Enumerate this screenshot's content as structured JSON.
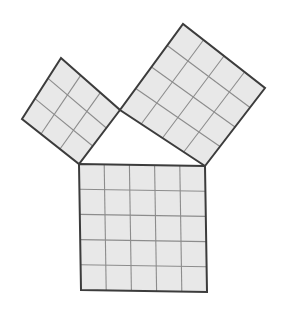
{
  "figure": {
    "background_color": "#ffffff",
    "square_fill_color": "#e8e8e8",
    "grid_line_color": "#8c8c8c",
    "outline_color": "#3c3c3c",
    "outline_width": 2,
    "grid_line_width": 1.1,
    "canvas": {
      "width": 284,
      "height": 315
    }
  },
  "triangle": {
    "name": "right-triangle",
    "right_angle_vertex": {
      "x": 120,
      "y": 110
    },
    "vertex_left": {
      "x": 79,
      "y": 164
    },
    "vertex_right": {
      "x": 205,
      "y": 166
    },
    "leg_a_length_units": 3,
    "leg_b_length_units": 4,
    "hypotenuse_length_units": 5
  },
  "squares": [
    {
      "id": "square-a",
      "label": "small square on short leg",
      "divisions": 3,
      "unit_area": 9,
      "corners": [
        {
          "x": 120,
          "y": 110
        },
        {
          "x": 79,
          "y": 164
        },
        {
          "x": 22,
          "y": 119
        },
        {
          "x": 61,
          "y": 58
        }
      ]
    },
    {
      "id": "square-b",
      "label": "medium square on long leg",
      "divisions": 4,
      "unit_area": 16,
      "corners": [
        {
          "x": 205,
          "y": 166
        },
        {
          "x": 120,
          "y": 110
        },
        {
          "x": 183,
          "y": 24
        },
        {
          "x": 265,
          "y": 88
        }
      ]
    },
    {
      "id": "square-c",
      "label": "large square on hypotenuse",
      "divisions": 5,
      "unit_area": 25,
      "corners": [
        {
          "x": 79,
          "y": 164
        },
        {
          "x": 205,
          "y": 166
        },
        {
          "x": 207,
          "y": 292
        },
        {
          "x": 81,
          "y": 290
        }
      ]
    }
  ],
  "chart_data": {
    "type": "diagram",
    "relation": "3^2 + 4^2 = 5^2",
    "areas": {
      "a": 9,
      "b": 16,
      "c": 25
    },
    "grid_divisions": {
      "a": 3,
      "b": 4,
      "c": 5
    }
  }
}
